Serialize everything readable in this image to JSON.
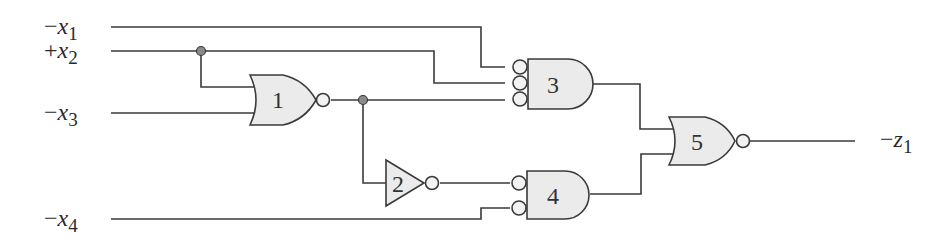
{
  "diagram": {
    "type": "logic-circuit",
    "colors": {
      "wire": "#3a3a3a",
      "gate_fill": "#ebebeb",
      "junction_fill": "#8a8a8a",
      "background": "#ffffff"
    },
    "inputs": [
      {
        "id": "x1",
        "sign": "−",
        "var": "x",
        "sub": "1"
      },
      {
        "id": "x2",
        "sign": "+",
        "var": "x",
        "sub": "2"
      },
      {
        "id": "x3",
        "sign": "−",
        "var": "x",
        "sub": "3"
      },
      {
        "id": "x4",
        "sign": "−",
        "var": "x",
        "sub": "4"
      }
    ],
    "output": {
      "id": "z1",
      "sign": "−",
      "var": "z",
      "sub": "1"
    },
    "gates": [
      {
        "id": "1",
        "label": "1",
        "kind": "NOR",
        "inputs": [
          "+x2",
          "-x3"
        ]
      },
      {
        "id": "2",
        "label": "2",
        "kind": "NOT",
        "inputs": [
          "gate1"
        ]
      },
      {
        "id": "3",
        "label": "3",
        "kind": "AND (inverted inputs)",
        "inputs": [
          "-x1",
          "+x2",
          "gate1"
        ]
      },
      {
        "id": "4",
        "label": "4",
        "kind": "AND (inverted inputs)",
        "inputs": [
          "gate2",
          "-x4"
        ]
      },
      {
        "id": "5",
        "label": "5",
        "kind": "NOR",
        "inputs": [
          "gate3",
          "gate4"
        ]
      }
    ]
  }
}
